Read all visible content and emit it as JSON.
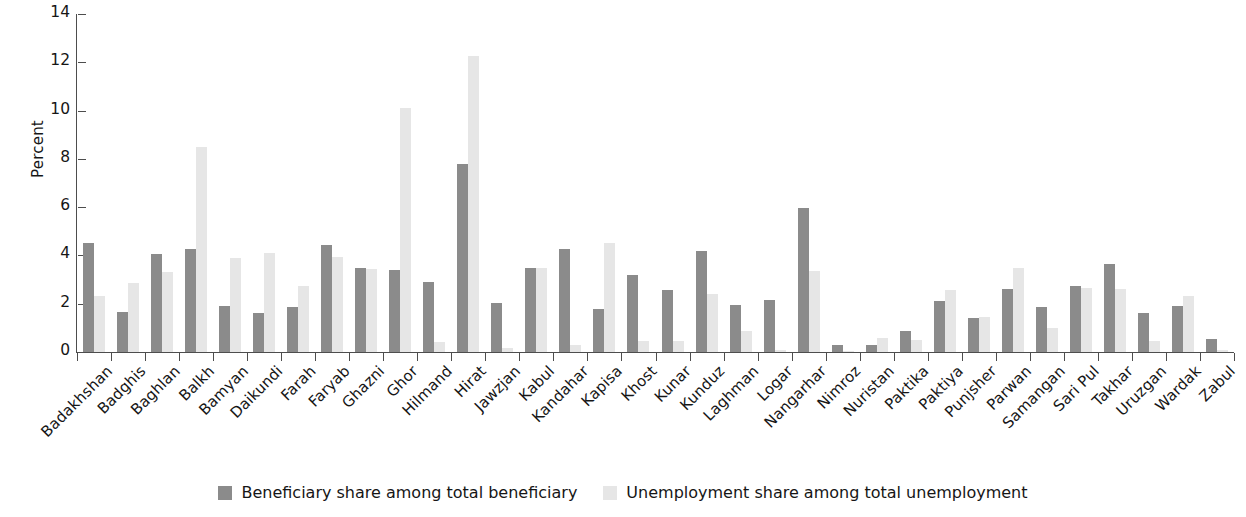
{
  "chart_data": {
    "type": "bar",
    "title": "",
    "subtitle": "",
    "xlabel": "",
    "ylabel": "Percent",
    "ylim": [
      0,
      14
    ],
    "yticks": [
      0,
      2,
      4,
      6,
      8,
      10,
      12,
      14
    ],
    "grid": false,
    "legend_position": "bottom",
    "colors": {
      "beneficiary": "#8b8b8b",
      "unemployment": "#e6e6e6",
      "axis": "#4d4d4d",
      "text": "#161616",
      "background": "#ffffff"
    },
    "categories": [
      "Badakhshan",
      "Badghis",
      "Baghlan",
      "Balkh",
      "Bamyan",
      "Daikundi",
      "Farah",
      "Faryab",
      "Ghazni",
      "Ghor",
      "Hilmand",
      "Hirat",
      "Jawzjan",
      "Kabul",
      "Kandahar",
      "Kapisa",
      "Khost",
      "Kunar",
      "Kunduz",
      "Laghman",
      "Logar",
      "Nangarhar",
      "Nimroz",
      "Nuristan",
      "Paktika",
      "Paktiya",
      "Punjsher",
      "Parwan",
      "Samangan",
      "Sari Pul",
      "Takhar",
      "Uruzgan",
      "Wardak",
      "Zabul"
    ],
    "series": [
      {
        "name": "Beneficiary share among total beneficiary",
        "color": "#8b8b8b",
        "values": [
          4.5,
          1.65,
          4.05,
          4.25,
          1.9,
          1.6,
          1.85,
          4.45,
          3.5,
          3.4,
          2.9,
          7.8,
          2.05,
          3.5,
          4.25,
          1.8,
          3.2,
          2.55,
          4.2,
          1.95,
          2.15,
          5.95,
          0.3,
          0.3,
          0.85,
          2.1,
          1.4,
          2.6,
          1.85,
          2.75,
          3.65,
          1.6,
          1.9,
          0.55
        ]
      },
      {
        "name": "Unemployment share among total unemployment",
        "color": "#e6e6e6",
        "values": [
          2.3,
          2.85,
          3.3,
          8.5,
          3.9,
          4.1,
          2.75,
          3.95,
          3.45,
          10.1,
          0.4,
          12.25,
          0.15,
          3.5,
          0.3,
          4.5,
          0.45,
          0.45,
          2.4,
          0.85,
          0.1,
          3.35,
          0.05,
          0.6,
          0.5,
          2.55,
          1.45,
          3.5,
          1.0,
          2.65,
          2.6,
          0.45,
          2.3,
          0.1
        ]
      }
    ]
  },
  "legend": {
    "items": [
      {
        "label": "Beneficiary share among total beneficiary",
        "swatch": "beneficiary"
      },
      {
        "label": "Unemployment share among total unemployment",
        "swatch": "unemployment"
      }
    ]
  }
}
